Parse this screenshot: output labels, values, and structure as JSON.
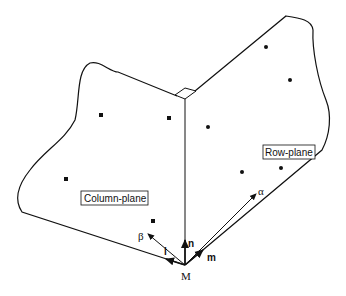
{
  "diagram": {
    "planes": [
      {
        "label": "Column-plane",
        "point_marker": "square"
      },
      {
        "label": "Row-plane",
        "point_marker": "circle"
      }
    ],
    "origin_label": "M",
    "vectors": [
      {
        "label": "n",
        "style": "bold"
      },
      {
        "label": "l",
        "style": "bold"
      },
      {
        "label": "m",
        "style": "bold"
      },
      {
        "label": "α",
        "style": "greek"
      },
      {
        "label": "β",
        "style": "greek"
      }
    ],
    "right_angle_marker": true,
    "stroke_color": "#111111",
    "background": "#ffffff"
  }
}
